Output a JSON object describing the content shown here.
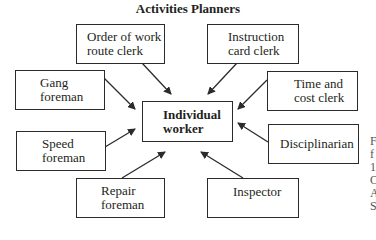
{
  "title": "Activities Planners",
  "center": {
    "line1": "Individual",
    "line2": "worker"
  },
  "boxes": [
    {
      "id": "order-of-work",
      "line1": "Order of work",
      "line2": "route clerk"
    },
    {
      "id": "instruction-card",
      "line1": "Instruction",
      "line2": "card clerk"
    },
    {
      "id": "gang-foreman",
      "line1": "Gang",
      "line2": "foreman"
    },
    {
      "id": "time-cost",
      "line1": "Time and",
      "line2": "cost clerk"
    },
    {
      "id": "speed-foreman",
      "line1": "Speed",
      "line2": "foreman"
    },
    {
      "id": "disciplinarian",
      "line1": "Disciplinarian",
      "line2": ""
    },
    {
      "id": "repair-foreman",
      "line1": "Repair",
      "line2": "foreman"
    },
    {
      "id": "inspector",
      "line1": "Inspector",
      "line2": ""
    }
  ],
  "edge_fragments": [
    "F",
    "f",
    "1",
    "C",
    "A",
    "S"
  ],
  "colors": {
    "stroke": "#2b2b2b",
    "text": "#231f20",
    "background": "#ffffff"
  }
}
